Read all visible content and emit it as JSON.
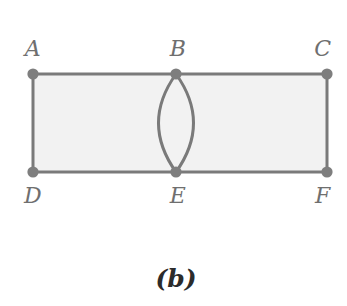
{
  "figure": {
    "caption": "(b)",
    "background_color": "#ffffff",
    "face_fill_color": "#f2f2f2",
    "edge_color": "#7a7a7a",
    "node_color": "#7e7e7e",
    "label_color": "#6f6f6f",
    "caption_color": "#2b2b2b",
    "edge_width": 3,
    "node_radius": 5.6,
    "vertices": [
      {
        "id": "A",
        "label": "A",
        "x": 33,
        "y": 74,
        "label_x": 33,
        "label_y": 49
      },
      {
        "id": "B",
        "label": "B",
        "x": 176,
        "y": 74,
        "label_x": 178,
        "label_y": 49
      },
      {
        "id": "C",
        "label": "C",
        "x": 327,
        "y": 74,
        "label_x": 323,
        "label_y": 49
      },
      {
        "id": "D",
        "label": "D",
        "x": 33,
        "y": 172,
        "label_x": 33,
        "label_y": 196
      },
      {
        "id": "E",
        "label": "E",
        "x": 176,
        "y": 172,
        "label_x": 178,
        "label_y": 196
      },
      {
        "id": "F",
        "label": "F",
        "x": 327,
        "y": 172,
        "label_x": 323,
        "label_y": 196
      }
    ],
    "edges": [
      {
        "id": "AB",
        "from": "A",
        "to": "B",
        "kind": "straight"
      },
      {
        "id": "BC",
        "from": "B",
        "to": "C",
        "kind": "straight"
      },
      {
        "id": "DE",
        "from": "D",
        "to": "E",
        "kind": "straight"
      },
      {
        "id": "EF",
        "from": "E",
        "to": "F",
        "kind": "straight"
      },
      {
        "id": "AD",
        "from": "A",
        "to": "D",
        "kind": "straight"
      },
      {
        "id": "CF",
        "from": "C",
        "to": "F",
        "kind": "straight"
      },
      {
        "id": "BE-left",
        "from": "B",
        "to": "E",
        "kind": "arc",
        "bow": -17.5
      },
      {
        "id": "BE-right",
        "from": "B",
        "to": "E",
        "kind": "arc",
        "bow": 17.5
      }
    ],
    "caption_x": 176,
    "caption_y": 278
  }
}
